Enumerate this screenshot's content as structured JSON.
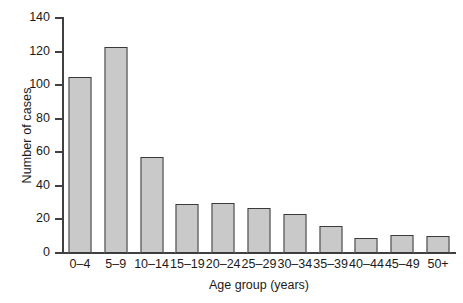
{
  "chart_data": {
    "type": "bar",
    "title": "",
    "subtitle": "",
    "xlabel": "Age group (years)",
    "ylabel": "Number of cases",
    "categories": [
      "0–4",
      "5–9",
      "10–14",
      "15–19",
      "20–24",
      "25–29",
      "30–34",
      "35–39",
      "40–44",
      "45–49",
      "50+"
    ],
    "values": [
      105,
      123,
      57,
      29,
      30,
      27,
      23,
      16,
      9,
      11,
      10
    ],
    "ylim": [
      0,
      140
    ],
    "xlim_note": "categorical",
    "ytick_values": [
      0,
      20,
      40,
      60,
      80,
      100,
      120,
      140
    ],
    "ytick_labels": [
      "0",
      "20",
      "40",
      "60",
      "80",
      "100",
      "120",
      "140"
    ],
    "grid": false,
    "legend": false,
    "legend_position": "none",
    "bar_fill_color": "#c9c9c9",
    "bar_edge_color": "#3a3a3a",
    "axis_color": "#404040",
    "background_color": "#ffffff",
    "annotations": []
  }
}
